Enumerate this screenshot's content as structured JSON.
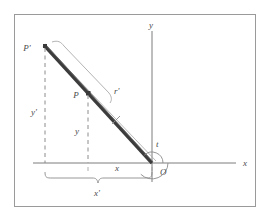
{
  "figure": {
    "kind": "geometry-diagram",
    "caption": "",
    "frame_color": "#9a9a9a",
    "background": "#ffffff",
    "axis_color": "#7d7d7d",
    "rod_color": "#3c3c3c",
    "dashed_color": "#8c8c8c",
    "brace_color": "#8c8c8c",
    "label_color": "#4a4a4a"
  },
  "axes": {
    "x_label": "x",
    "y_label": "y",
    "origin_label": "O"
  },
  "points": {
    "p_label": "P",
    "p_prime_label": "P'"
  },
  "segments": {
    "r_label": "r",
    "r_prime_label": "r'"
  },
  "angle": {
    "t_label": "t"
  },
  "projections": {
    "y_label": "y",
    "y_prime_label": "y'",
    "x_label": "x",
    "x_prime_label": "x'"
  }
}
